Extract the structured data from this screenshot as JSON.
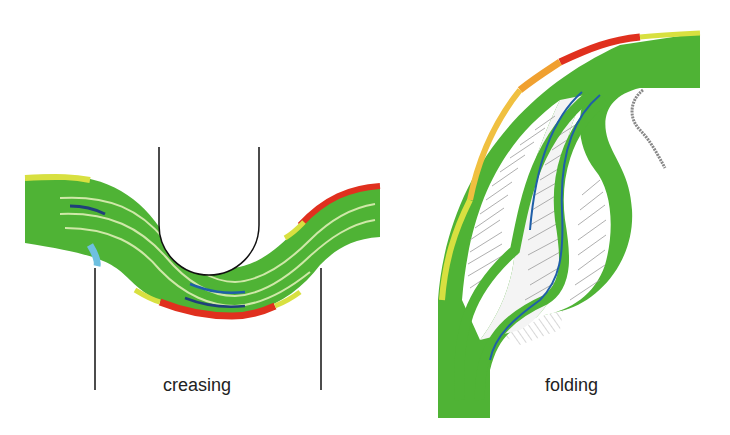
{
  "panels": [
    {
      "name": "creasing",
      "label": "creasing"
    },
    {
      "name": "folding",
      "label": "folding"
    }
  ],
  "colors": {
    "board": "#4fb335",
    "tension": "#e0301e",
    "moderate": "#f0a030",
    "low": "#d8e040",
    "compression": "#1f5fa8",
    "light_compression": "#6ec0e0",
    "tool": "#111111",
    "gap_lines": "#9a9a9a"
  }
}
